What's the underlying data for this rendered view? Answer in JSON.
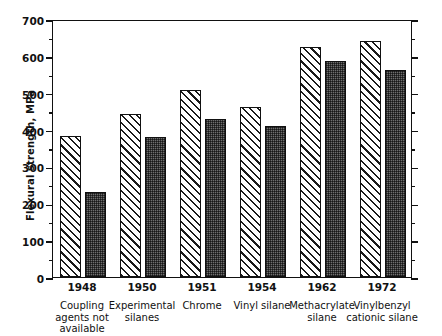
{
  "chart_data": {
    "type": "bar",
    "title": "",
    "xlabel": "",
    "ylabel": "Flexural strength, MPa",
    "ylim": [
      0,
      700
    ],
    "ytick_step": 100,
    "yminor_step": 50,
    "grid": false,
    "legend": "none",
    "categories": [
      "1948",
      "1950",
      "1951",
      "1954",
      "1962",
      "1972"
    ],
    "category_descriptions": [
      "Coupling agents not available",
      "Experimental silanes",
      "Chrome",
      "Vinyl silane",
      "Methacrylate silane",
      "Vinylbenzyl cationic silane"
    ],
    "yticklabels": [
      "0",
      "100",
      "200",
      "300",
      "400",
      "500",
      "600",
      "700"
    ],
    "series": [
      {
        "name": "dry",
        "fill": "diagonal-hatch",
        "values": [
          383,
          443,
          507,
          462,
          625,
          640
        ]
      },
      {
        "name": "wet",
        "fill": "dark-stipple",
        "values": [
          232,
          381,
          430,
          410,
          585,
          562
        ]
      }
    ],
    "colors": {
      "axis": "#111111",
      "hatch_bar_face": "#ffffff",
      "hatch_bar_line": "#1a1a1a",
      "stipple_bar_face": "#6e6e6e",
      "background": "#ffffff"
    }
  }
}
